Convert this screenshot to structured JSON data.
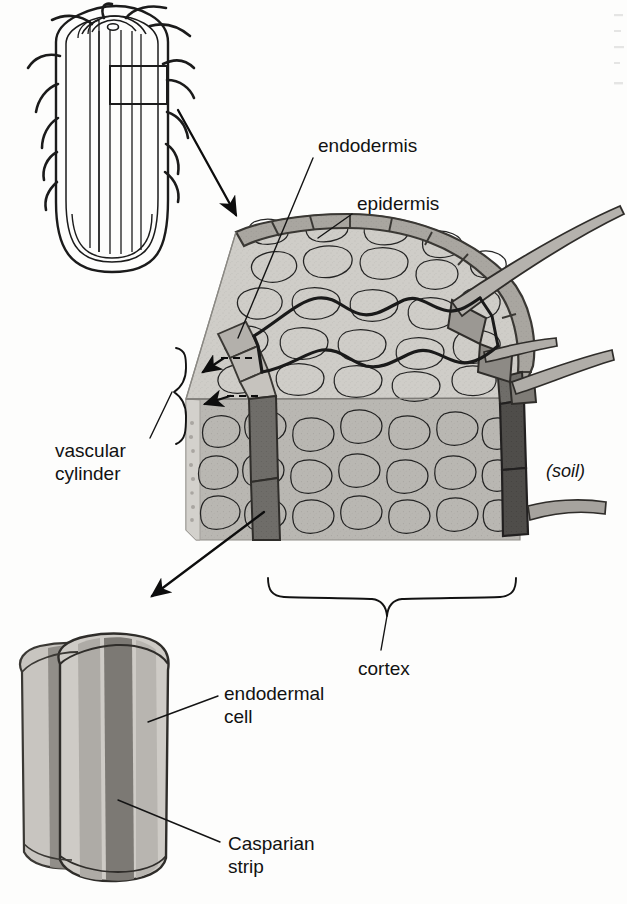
{
  "figure": {
    "title_semantic": "root-endodermis-casparian-strip-diagram",
    "background_color": "#fdfdfc",
    "ink_color": "#1b1b1b"
  },
  "labels": {
    "endodermis": "endodermis",
    "epidermis": "epidermis",
    "vascular_line1": "vascular",
    "vascular_line2": "cylinder",
    "soil": "(soil)",
    "cortex": "cortex",
    "endodermal_cell_line1": "endodermal",
    "endodermal_cell_line2": "cell",
    "casparian_line1": "Casparian",
    "casparian_line2": "strip"
  },
  "panels": {
    "root_tip": {
      "name": "root-tip-longitudinal-section",
      "description": "Outline drawing of a root tip with root hairs and vascular strands, with a rectangular callout box marking the magnified region"
    },
    "block": {
      "name": "root-block-3d-cutaway",
      "description": "Three dimensional cut-away block of root tissue showing epidermis, cortex, endodermis with Casparian strip, and root hairs projecting into the soil"
    },
    "endodermal_cell": {
      "name": "endodermal-cell-magnification",
      "description": "Magnified pair of endodermal cells showing the dark Casparian strip band encircling the cell walls"
    }
  },
  "colors": {
    "cortex_top_fill": "#cfcdc8",
    "cortex_front_fill": "#b9b7b2",
    "epidermis_fill": "#a7a49e",
    "endodermis_dark": "#6f6d69",
    "endodermis_darkest": "#4c4a47",
    "cell_outline": "#8b8884",
    "strip_band": "#7b7874"
  }
}
